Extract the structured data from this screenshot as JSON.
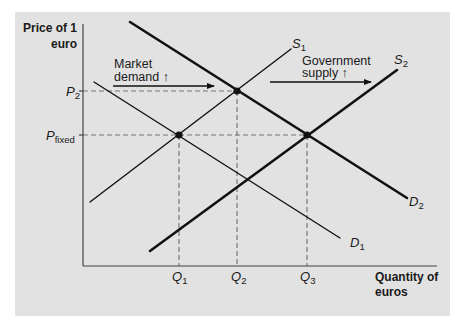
{
  "figure": {
    "y_axis_label": [
      "Price of 1",
      "euro"
    ],
    "x_axis_label": [
      "Quantity of",
      "euros"
    ],
    "price_labels": [
      {
        "main": "P",
        "sub": "2"
      },
      {
        "main": "P",
        "sub": "fixed"
      }
    ],
    "quantity_labels": [
      {
        "main": "Q",
        "sub": "1"
      },
      {
        "main": "Q",
        "sub": "2"
      },
      {
        "main": "Q",
        "sub": "3"
      }
    ],
    "curve_labels": {
      "s1": {
        "main": "S",
        "sub": "1"
      },
      "s2": {
        "main": "S",
        "sub": "2"
      },
      "d1": {
        "main": "D",
        "sub": "1"
      },
      "d2": {
        "main": "D",
        "sub": "2"
      }
    },
    "annotations": {
      "market_demand": [
        "Market",
        "demand ↑"
      ],
      "government_supply": [
        "Government",
        "supply ↑"
      ]
    },
    "equilibria": [
      {
        "price": "P_fixed",
        "quantity": "Q1",
        "curves": "S1 & D1"
      },
      {
        "price": "P2",
        "quantity": "Q2",
        "curves": "S1 & D2"
      },
      {
        "price": "P_fixed",
        "quantity": "Q3",
        "curves": "S2 & D2"
      }
    ]
  },
  "colors": {
    "panel": "#e2e2e2",
    "curve": "#111111",
    "axis": "#444444",
    "dashed": "#777777"
  }
}
